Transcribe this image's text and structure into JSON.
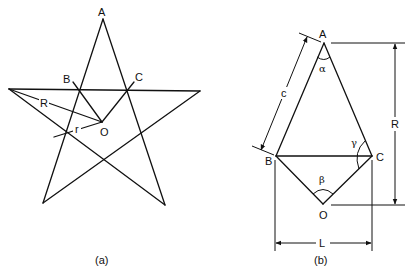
{
  "figure_a": {
    "caption": "(a)",
    "labels": {
      "apex": "A",
      "vertex_b": "B",
      "vertex_c": "C",
      "center": "O",
      "circumradius": "R",
      "inradius": "r"
    }
  },
  "figure_b": {
    "caption": "(b)",
    "labels": {
      "apex": "A",
      "vertex_b": "B",
      "vertex_c": "C",
      "center": "O",
      "side_length": "c",
      "height": "R",
      "base_width": "L",
      "angle_a": "α",
      "angle_o": "β",
      "angle_c": "γ"
    }
  }
}
